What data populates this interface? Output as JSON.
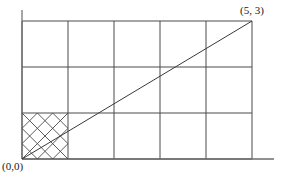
{
  "figure": {
    "name": "grid-line-rasterization-diagram",
    "labels": {
      "origin": "(0,0)",
      "endpoint": "(5, 3)"
    }
  },
  "chart_data": {
    "type": "line",
    "title": "",
    "xlabel": "",
    "ylabel": "",
    "xlim": [
      0,
      5
    ],
    "ylim": [
      0,
      3
    ],
    "grid": true,
    "legend": false,
    "x_ticks": [
      0,
      1,
      2,
      3,
      4,
      5
    ],
    "y_ticks": [
      0,
      1,
      2,
      3
    ],
    "series": [
      {
        "name": "ideal-line",
        "points": [
          [
            0,
            0
          ],
          [
            5,
            3
          ]
        ],
        "annotations": [
          "(0,0)",
          "(5, 3)"
        ]
      }
    ],
    "hatched_cell": {
      "x_range": [
        0,
        1
      ],
      "y_range": [
        0,
        1
      ],
      "pattern": "crosshatch-diamond"
    }
  },
  "geometry": {
    "plot": {
      "left": 22,
      "right": 252,
      "top": 21,
      "bottom": 159
    },
    "axis": {
      "x_extend": 274,
      "y_extend": 10
    },
    "grid_x": [
      22,
      68,
      114,
      160,
      206,
      252
    ],
    "grid_y": [
      21,
      67,
      113,
      159
    ],
    "hatch": {
      "x0": 22,
      "x1": 68,
      "y0": 113,
      "y1": 159,
      "steps": 3
    },
    "colors": {
      "grid": "#4a4a4a",
      "axis": "#6b6b6b",
      "line": "#3a3a3a",
      "hatch": "#4a4a4a",
      "text": "#1a1a1a",
      "background": "#ffffff"
    }
  }
}
